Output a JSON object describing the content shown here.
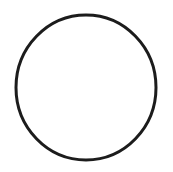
{
  "canvas": {
    "width": 173,
    "height": 172,
    "background_color": "#ffffff",
    "title": "Circle"
  },
  "figure": {
    "kind": "circle-outline",
    "name": "circle",
    "label": "Circle",
    "geometry": {
      "center_x": 86,
      "center_y": 87.5,
      "radius_x": 70,
      "radius_y": 72.5,
      "left_edge_x": 16,
      "right_edge_x": 156,
      "top_edge_y": 15,
      "bottom_edge_y": 160
    },
    "style": {
      "stroke_color": "#1c1c1c",
      "stroke_width": 3,
      "fill_color": "none",
      "line_cap": "round",
      "antialiased": true
    }
  },
  "interior": {
    "name": "circle-interior",
    "fill_color": "#ffffff",
    "content": ""
  }
}
